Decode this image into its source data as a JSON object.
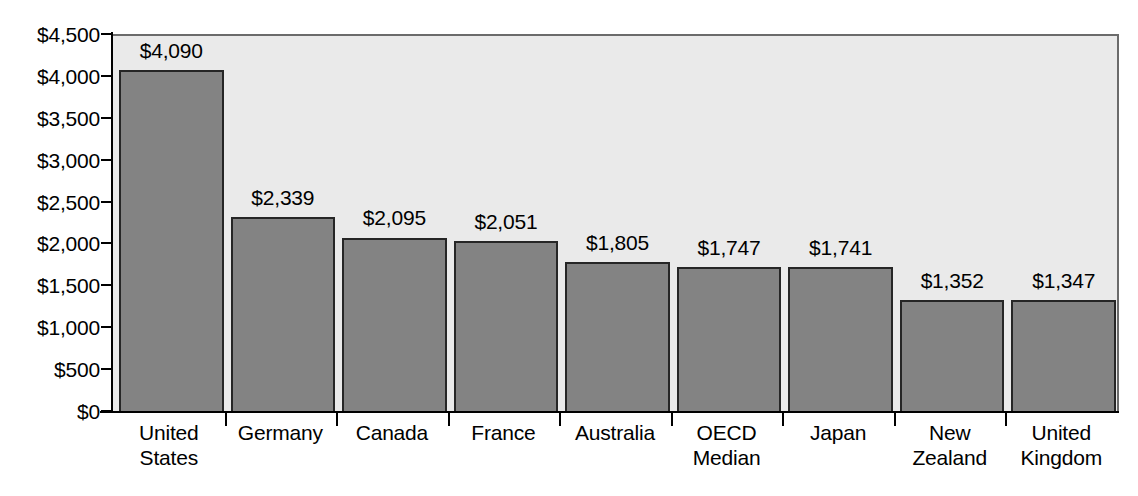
{
  "chart_data": {
    "type": "bar",
    "title": "",
    "subtitle": "",
    "xlabel": "",
    "ylabel": "",
    "ylim": [
      0,
      4500
    ],
    "grid": false,
    "legend": false,
    "legend_position": "none",
    "orientation": "vertical",
    "categories": [
      "United States",
      "Germany",
      "Canada",
      "France",
      "Australia",
      "OECD Median",
      "Japan",
      "New Zealand",
      "United Kingdom"
    ],
    "category_lines": [
      [
        "United",
        "States"
      ],
      [
        "Germany"
      ],
      [
        "Canada"
      ],
      [
        "France"
      ],
      [
        "Australia"
      ],
      [
        "OECD",
        "Median"
      ],
      [
        "Japan"
      ],
      [
        "New",
        "Zealand"
      ],
      [
        "United",
        "Kingdom"
      ]
    ],
    "values": [
      4090,
      2339,
      2095,
      2051,
      1805,
      1747,
      1741,
      1352,
      1347
    ],
    "value_labels": [
      "$4,090",
      "$2,339",
      "$2,095",
      "$2,051",
      "$1,805",
      "$1,747",
      "$1,741",
      "$1,352",
      "$1,347"
    ],
    "y_ticks": [
      0,
      500,
      1000,
      1500,
      2000,
      2500,
      3000,
      3500,
      4000,
      4500
    ],
    "y_tick_labels": [
      "$0",
      "$500",
      "$1,000",
      "$1,500",
      "$2,000",
      "$2,500",
      "$3,000",
      "$3,500",
      "$4,000",
      "$4,500"
    ],
    "colors": {
      "bar_fill": "#838383",
      "bar_border": "#262626",
      "plot_background": "#eaeaea",
      "page_background": "#ffffff",
      "axis": "#000000",
      "text": "#000000"
    }
  }
}
